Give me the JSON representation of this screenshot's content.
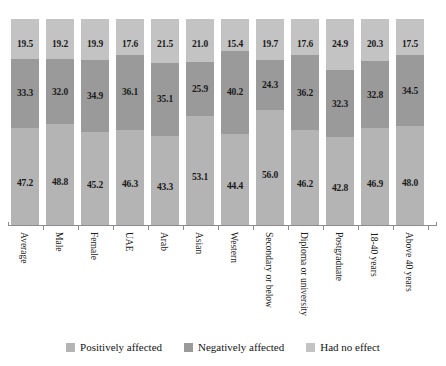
{
  "chart_data": {
    "type": "bar",
    "stacked": true,
    "stack_mode": "percent",
    "orientation": "vertical",
    "title": "",
    "subtitle": "",
    "xlabel": "",
    "ylabel": "",
    "ylim": [
      0,
      100
    ],
    "grid": false,
    "legend_position": "bottom",
    "value_label_format": "0.0",
    "axis_tick_labels_rotated": true,
    "categories": [
      "Average",
      "Male",
      "Female",
      "UAE",
      "Arab",
      "Asian",
      "Western",
      "Secondary or below",
      "Diploma or university",
      "Postgraduate",
      "18-40 years",
      "Above 40 years"
    ],
    "series": [
      {
        "name": "Positively affected",
        "color": "#b4b4b4",
        "stack_order": 0,
        "values": [
          47.2,
          48.8,
          45.2,
          46.3,
          43.3,
          53.1,
          44.4,
          56.0,
          46.2,
          42.8,
          46.9,
          48.0
        ]
      },
      {
        "name": "Negatively affected",
        "color": "#9a9a9a",
        "stack_order": 1,
        "values": [
          33.3,
          32.0,
          34.9,
          36.1,
          35.1,
          25.9,
          40.2,
          24.3,
          36.2,
          32.3,
          32.8,
          34.5
        ]
      },
      {
        "name": "Had no effect",
        "color": "#c3c3c3",
        "stack_order": 2,
        "values": [
          19.5,
          19.2,
          19.9,
          17.6,
          21.5,
          21.0,
          15.4,
          19.7,
          17.6,
          24.9,
          20.3,
          17.5
        ]
      }
    ]
  },
  "legend": {
    "items": [
      {
        "label": "Positively affected",
        "color": "#b4b4b4"
      },
      {
        "label": "Negatively affected",
        "color": "#9a9a9a"
      },
      {
        "label": "Had no effect",
        "color": "#c3c3c3"
      }
    ]
  },
  "axis": {
    "line_color": "#8c8c8c"
  }
}
